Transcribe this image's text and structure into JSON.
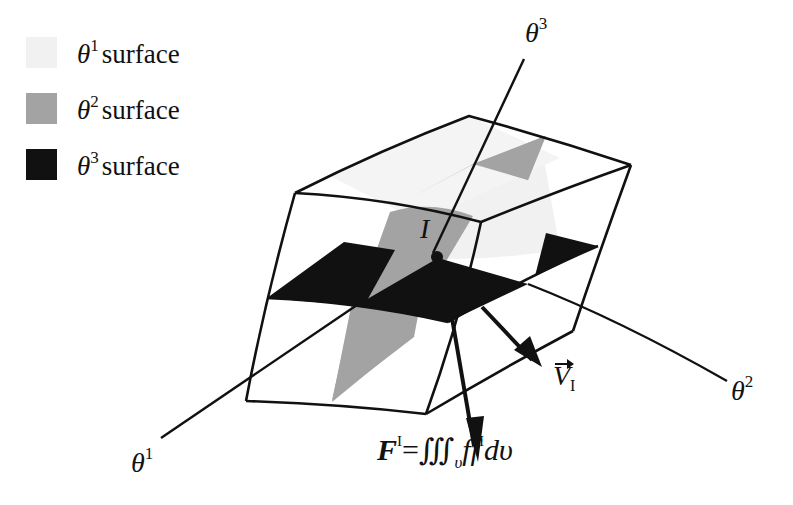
{
  "legend": {
    "items": [
      {
        "symbol": "θ",
        "superscript": "1",
        "text": "surface",
        "color": "#f1f1f1"
      },
      {
        "symbol": "θ",
        "superscript": "2",
        "text": "surface",
        "color": "#a3a3a3"
      },
      {
        "symbol": "θ",
        "superscript": "3",
        "text": "surface",
        "color": "#111111"
      }
    ]
  },
  "axes": {
    "theta1": {
      "symbol": "θ",
      "superscript": "1"
    },
    "theta2": {
      "symbol": "θ",
      "superscript": "2"
    },
    "theta3": {
      "symbol": "θ",
      "superscript": "3"
    }
  },
  "point": {
    "label": "I"
  },
  "velocity": {
    "symbol": "V",
    "subscript": "I"
  },
  "formula": {
    "lhs": "F",
    "lhs_sup": "I",
    "equals": "=",
    "integral": "∭",
    "integral_sub": "υ",
    "integrand_f": "f",
    "integrand_f2": "f",
    "integrand_sup": "I",
    "differential": "dυ"
  },
  "colors": {
    "outline": "#111111",
    "theta1_surface": "#f1f1f1",
    "theta2_surface": "#a3a3a3",
    "theta3_surface": "#111111",
    "background": "#ffffff"
  }
}
